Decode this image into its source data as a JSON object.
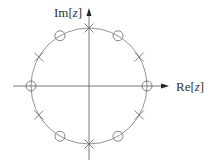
{
  "diagram": {
    "type": "pole-zero-plot",
    "axes": {
      "imag_label": {
        "prefix": "Im[",
        "var": "z",
        "suffix": "]"
      },
      "real_label": {
        "prefix": "Re[",
        "var": "z",
        "suffix": "]"
      }
    },
    "unit_circle": {
      "cx": 89,
      "cy": 86,
      "r": 58,
      "color": "#777777"
    },
    "axis_color": "#555555",
    "marker_color": "#666666",
    "zeros_deg": [
      0,
      60,
      120,
      180,
      240,
      300
    ],
    "poles_deg": [
      30,
      90,
      150,
      210,
      270,
      330
    ],
    "legend": {
      "zero_marker": "circle (o)",
      "pole_marker": "cross (x)"
    }
  }
}
